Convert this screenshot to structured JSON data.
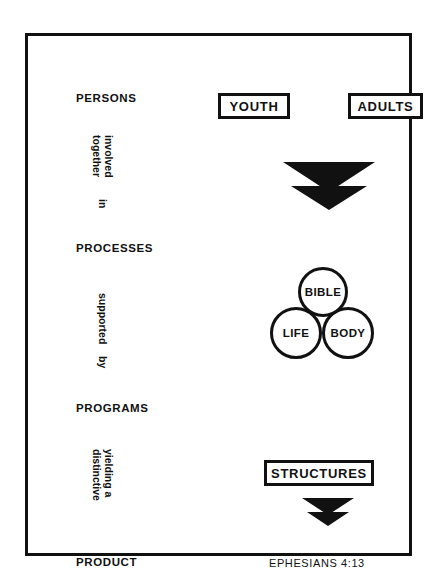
{
  "diagram": {
    "frame_color": "#111111",
    "background": "#ffffff"
  },
  "stages": [
    {
      "id": "persons",
      "label": "PERSONS"
    },
    {
      "id": "processes",
      "label": "PROCESSES"
    },
    {
      "id": "programs",
      "label": "PROGRAMS"
    },
    {
      "id": "product",
      "label": "PRODUCT"
    }
  ],
  "connectors": [
    {
      "id": "connector-1",
      "line1": "involved",
      "line2": "together",
      "line3": "in"
    },
    {
      "id": "connector-2",
      "line1": "supported",
      "line2": "by"
    },
    {
      "id": "connector-3",
      "line1": "yielding a",
      "line2": "distinctive"
    }
  ],
  "persons_boxes": [
    {
      "id": "youth",
      "label": "YOUTH"
    },
    {
      "id": "adults",
      "label": "ADULTS"
    }
  ],
  "processes_circles": [
    {
      "id": "bible",
      "label": "BIBLE"
    },
    {
      "id": "life",
      "label": "LIFE"
    },
    {
      "id": "body",
      "label": "BODY"
    }
  ],
  "programs_box": {
    "id": "structures",
    "label": "STRUCTURES"
  },
  "product": {
    "reference": "EPHESIANS 4:13"
  },
  "arrows": [
    {
      "id": "arrow-persons-to-processes",
      "icon": "double-chevron-down-icon",
      "size": "large"
    },
    {
      "id": "arrow-structures-to-product",
      "icon": "double-chevron-down-icon",
      "size": "small"
    }
  ]
}
